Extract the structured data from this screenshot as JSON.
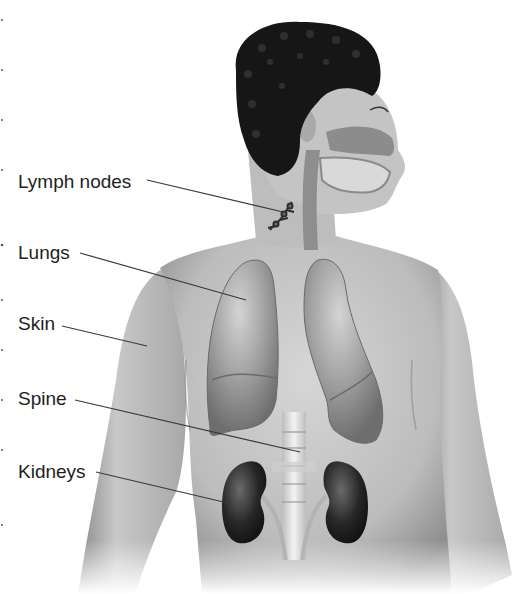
{
  "diagram": {
    "labels": [
      {
        "id": "lymph-nodes",
        "text": "Lymph nodes",
        "x": 18,
        "y": 172,
        "target": [
          283,
          212
        ]
      },
      {
        "id": "lungs",
        "text": "Lungs",
        "x": 18,
        "y": 243,
        "target": [
          246,
          300
        ]
      },
      {
        "id": "skin",
        "text": "Skin",
        "x": 18,
        "y": 314,
        "target": [
          147,
          346
        ]
      },
      {
        "id": "spine",
        "text": "Spine",
        "x": 18,
        "y": 389,
        "target": [
          300,
          452
        ]
      },
      {
        "id": "kidneys",
        "text": "Kidneys",
        "x": 18,
        "y": 462,
        "target": [
          232,
          504
        ]
      }
    ],
    "structures": [
      "head",
      "hair",
      "nasal-cavity",
      "oral-cavity",
      "trachea",
      "lymph-nodes",
      "right-lung",
      "left-lung",
      "spine",
      "right-kidney",
      "left-kidney",
      "ureters",
      "torso-skin"
    ]
  },
  "colors": {
    "background": "#ffffff",
    "label_text": "#1e1e1e",
    "leader_line": "#3a3a3a",
    "skin": "#c9c9c9",
    "skin_shadow": "#8e8e8e",
    "hair": "#141414",
    "lung": "#9c9c9c",
    "lung_highlight": "#cfcfcf",
    "kidney": "#2a2a2a",
    "spine": "#e8e8e8",
    "airway": "#8a8a8a"
  }
}
